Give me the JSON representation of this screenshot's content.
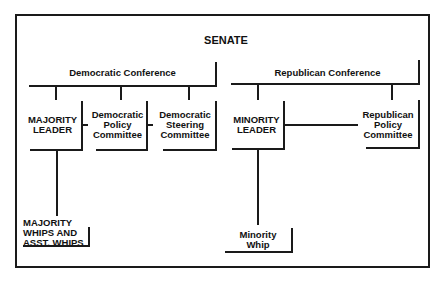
{
  "diagram": {
    "title": "SENATE",
    "democratic": {
      "conference": "Democratic Conference",
      "majority_leader": [
        "MAJORITY",
        "LEADER"
      ],
      "policy_committee": [
        "Democratic",
        "Policy",
        "Committee"
      ],
      "steering_committee": [
        "Democratic",
        "Steering",
        "Committee"
      ],
      "whips": [
        "MAJORITY",
        "WHIPS AND",
        "ASST. WHIPS"
      ]
    },
    "republican": {
      "conference": "Republican Conference",
      "minority_leader": [
        "MINORITY",
        "LEADER"
      ],
      "policy_committee": [
        "Republican",
        "Policy",
        "Committee"
      ],
      "whip": [
        "Minority",
        "Whip"
      ]
    }
  }
}
